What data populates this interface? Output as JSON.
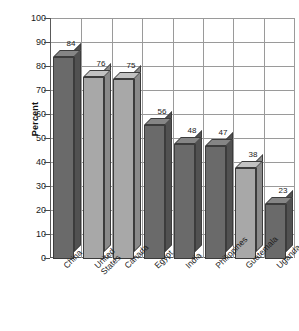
{
  "chart_data": {
    "type": "bar",
    "title": "",
    "xlabel": "",
    "ylabel": "Percent",
    "categories": [
      "China",
      "United States",
      "Canada",
      "Egypt",
      "India",
      "Philippines",
      "Guatemala",
      "Uganda"
    ],
    "values": [
      84,
      76,
      75,
      56,
      48,
      47,
      38,
      23
    ],
    "ylim": [
      0,
      100
    ],
    "ytick_labels": [
      "100",
      "90",
      "80",
      "70",
      "60",
      "50",
      "40",
      "30",
      "20",
      "10",
      "0"
    ],
    "ytick_values": [
      100,
      90,
      80,
      70,
      60,
      50,
      40,
      30,
      20,
      10,
      0
    ],
    "grid": true,
    "legend": "none",
    "style_3d": true,
    "bar_shades": [
      "dark",
      "light",
      "light",
      "dark",
      "dark",
      "dark",
      "light",
      "dark"
    ],
    "colors": {
      "bar_dark_front": "#6a6a6a",
      "bar_dark_side": "#515151",
      "bar_dark_top": "#858585",
      "bar_light_front": "#a8a8a8",
      "bar_light_side": "#8a8a8a",
      "bar_light_top": "#c2c2c2",
      "grid": "#9a9a9a",
      "axis": "#5a5a5a",
      "text": "#1a1a1a",
      "background": "#ffffff"
    },
    "data_labels": [
      "84",
      "76",
      "75",
      "56",
      "48",
      "47",
      "38",
      "23"
    ],
    "category_label_lines": [
      [
        "China"
      ],
      [
        "United",
        "States"
      ],
      [
        "Canada"
      ],
      [
        "Egypt"
      ],
      [
        "India"
      ],
      [
        "Philippines"
      ],
      [
        "Guatemala"
      ],
      [
        "Uganda"
      ]
    ]
  }
}
